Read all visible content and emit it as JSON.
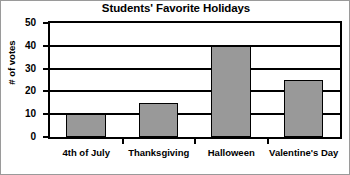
{
  "chart_data": {
    "type": "bar",
    "title": "Students' Favorite Holidays",
    "xlabel": "",
    "ylabel": "# of votes",
    "categories": [
      "4th of July",
      "Thanksgiving",
      "Halloween",
      "Valentine's Day"
    ],
    "values": [
      10,
      15,
      40,
      25
    ],
    "ylim": [
      0,
      50
    ],
    "ytick_step": 10,
    "yticks": [
      "50",
      "40",
      "30",
      "20",
      "10",
      "0"
    ],
    "ytick_values": [
      50,
      40,
      30,
      20,
      10,
      0
    ],
    "grid": true,
    "legend": false,
    "legend_position": "none",
    "bar_color": "#999999",
    "bar_border_color": "#000000",
    "axis_color": "#000000",
    "background_color": "#ffffff"
  },
  "figure": {
    "border_color": "#9a9a9a"
  }
}
